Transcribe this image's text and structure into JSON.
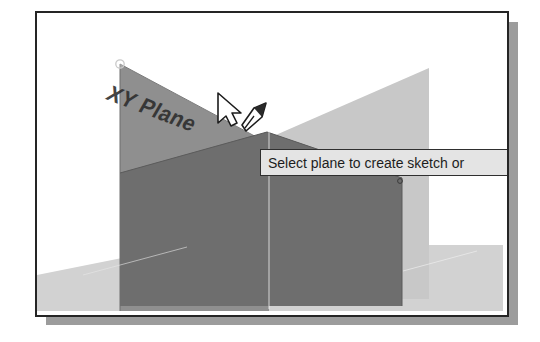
{
  "app": {
    "type": "cad-3d-viewport",
    "title": "3D modeling viewport"
  },
  "viewport": {
    "labels": {
      "xy_plane": "XY Plane"
    },
    "handles": {
      "plane_corner": "plane-corner-handle"
    },
    "cursor": {
      "pointer_icon": "arrow-pointer-icon",
      "mode_icon": "sketch-pencil-icon"
    }
  },
  "tooltip": {
    "text": "Select plane to create sketch or",
    "truncated": true
  },
  "colors": {
    "frame_border": "#252525",
    "frame_shadow": "#9c9c9c",
    "background": "#ffffff",
    "plane_highlight": "#8f8f8f",
    "plane_back": "#c8c8c8",
    "plane_ground": "#d2d2d2",
    "box_front": "#6e6e6e",
    "box_side": "#787878",
    "tooltip_bg": "#e4e4e4",
    "tooltip_border": "#2f2f2f",
    "axis_line": "#f2f2f2"
  }
}
